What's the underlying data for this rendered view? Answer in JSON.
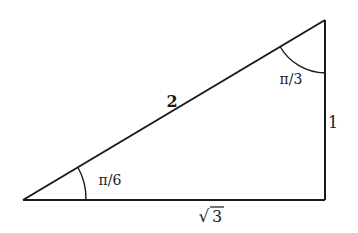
{
  "diagram": {
    "type": "right-triangle",
    "colors": {
      "stroke": "#1a1a1a",
      "background": "#ffffff"
    },
    "vertices": {
      "left": {
        "x": 23,
        "y": 200
      },
      "right_angle": {
        "x": 325,
        "y": 200
      },
      "top": {
        "x": 325,
        "y": 20
      }
    },
    "sides": {
      "hypotenuse": {
        "label": "2"
      },
      "vertical": {
        "label": "1"
      },
      "base": {
        "label": "√3",
        "radicand": "3",
        "radical_sign": "√"
      }
    },
    "angles": {
      "left": {
        "label": "π/6"
      },
      "top": {
        "label": "π/3"
      }
    }
  }
}
